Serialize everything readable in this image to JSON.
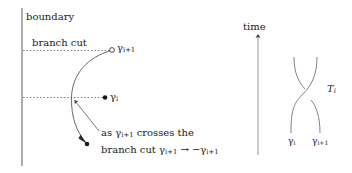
{
  "figure": {
    "background_color": "#ffffff",
    "line_color": "#555555",
    "text_color": "#1a1a1a",
    "width": 352,
    "height": 173
  },
  "left_panel": {
    "boundary_label": "boundary",
    "branch_cut_label": "branch cut",
    "endpoint_upper_label": "γᵢ₊₁",
    "endpoint_upper_label_base": "γ",
    "endpoint_upper_label_sub": "i+1",
    "endpoint_middle_label_base": "γ",
    "endpoint_middle_label_sub": "i",
    "caption_line_1_prefix": "as ",
    "caption_line_1_gamma_base": "γ",
    "caption_line_1_gamma_sub": "i+1",
    "caption_line_1_suffix": " crosses the",
    "caption_line_2_prefix": "branch cut ",
    "caption_line_2_gamma_a_base": "γ",
    "caption_line_2_gamma_a_sub": "i+1",
    "caption_line_2_arrow": " → −",
    "caption_line_2_gamma_b_base": "γ",
    "caption_line_2_gamma_b_sub": "i+1",
    "marker_upper_type": "open-circle",
    "marker_middle_type": "filled-dot",
    "marker_lower_type": "filled-dot"
  },
  "right_panel": {
    "time_axis_label": "time",
    "braid_generator_label": "T",
    "braid_generator_label_sub": "i",
    "strand_left_label_base": "γ",
    "strand_left_label_sub": "i",
    "strand_right_label_base": "γ",
    "strand_right_label_sub": "i+1"
  }
}
